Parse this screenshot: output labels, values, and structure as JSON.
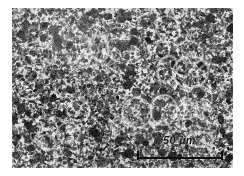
{
  "figure": {
    "kind": "micrograph",
    "modality": "light-microscopy",
    "caption": "Grayscale micrograph showing a dense fine speckled microstructure"
  },
  "plate": {
    "x": 12,
    "y": 8,
    "width": 221,
    "height": 160,
    "background_color": "#c9c9c9",
    "speckle_color": "#1d1d1d",
    "highlight_color": "#f0f0f0",
    "border": "none"
  },
  "scale_bar": {
    "label": "50 µm",
    "value": 50,
    "unit": "µm",
    "bar_color": "#111111",
    "text_color": "#151515",
    "bar_length_px": 86,
    "position": "bottom-right",
    "has_end_caps": true
  },
  "page": {
    "background_color": "#ffffff",
    "width": 244,
    "height": 176
  }
}
